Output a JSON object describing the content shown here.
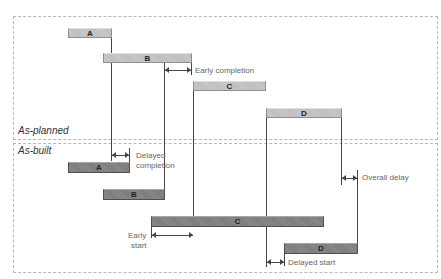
{
  "panels": {
    "planned": {
      "label": "As-planned"
    },
    "built": {
      "label": "As-built"
    }
  },
  "planned_bars": [
    {
      "id": "A",
      "label": "A"
    },
    {
      "id": "B",
      "label": "B"
    },
    {
      "id": "C",
      "label": "C"
    },
    {
      "id": "D",
      "label": "D"
    }
  ],
  "built_bars": [
    {
      "id": "A",
      "label": "A"
    },
    {
      "id": "B",
      "label": "B"
    },
    {
      "id": "C",
      "label": "C"
    },
    {
      "id": "D",
      "label": "D"
    }
  ],
  "annotations": {
    "early_completion": "Early completion",
    "delayed_completion_line1": "Delayed",
    "delayed_completion_line2": "completion",
    "early_start_line1": "Early",
    "early_start_line2": "start",
    "delayed_start": "Delayed start",
    "overall_delay": "Overall delay"
  },
  "colors": {
    "planned_bar": "#c4c4c4",
    "built_bar": "#848484",
    "line": "#444444",
    "annotation_text": "#666666",
    "panel_border": "#b8b8b8"
  }
}
